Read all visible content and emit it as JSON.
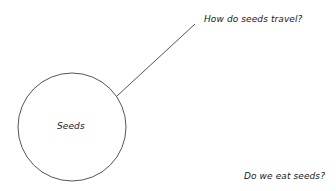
{
  "diagram": {
    "type": "mind-map",
    "center": {
      "label": "Seeds",
      "shape": "circle",
      "cx": 72,
      "cy": 127,
      "r": 54
    },
    "branches": [
      {
        "label": "How do seeds travel?",
        "connected": true,
        "line": {
          "x1": 117,
          "y1": 96,
          "x2": 195,
          "y2": 24
        }
      },
      {
        "label": "Do we eat seeds?",
        "connected": false
      }
    ],
    "colors": {
      "stroke": "#555555",
      "text": "#1a1a1a",
      "background": "#ffffff"
    }
  }
}
